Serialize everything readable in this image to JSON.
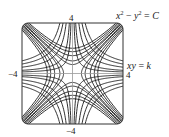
{
  "chart_data": {
    "type": "line",
    "title": "",
    "xlim": [
      -4,
      4
    ],
    "ylim": [
      -4,
      4
    ],
    "grid": false,
    "axes_visible": true,
    "tick_labels": {
      "top": "4",
      "bottom": "−4",
      "left": "−4",
      "right": "4"
    },
    "series": [
      {
        "name": "x² − y² = C",
        "family": "x2_minus_y2",
        "values": [
          -4,
          -3,
          -2,
          -1,
          -0.5,
          0.5,
          1,
          2,
          3,
          4
        ]
      },
      {
        "name": "xy = k",
        "family": "xy",
        "values": [
          -4,
          -3,
          -2,
          -1,
          -0.5,
          0.5,
          1,
          2,
          3,
          4
        ]
      }
    ],
    "annotations": [
      {
        "text": "x² − y² = C",
        "position": "top-right"
      },
      {
        "text": "xy = k",
        "position": "right"
      }
    ],
    "colors": {
      "curve": "#1a1a1a",
      "axis": "#999999",
      "frame": "#333333"
    }
  },
  "labels": {
    "eq1_x": "x",
    "eq1_sup1": "2",
    "eq1_mid": " − ",
    "eq1_y": "y",
    "eq1_sup2": "2",
    "eq1_eq": " = ",
    "eq1_c": "C",
    "eq2_xy": "xy",
    "eq2_eq": " = ",
    "eq2_k": "k",
    "tick_top": "4",
    "tick_bottom": "−4",
    "tick_left": "−4",
    "tick_right": "4"
  }
}
